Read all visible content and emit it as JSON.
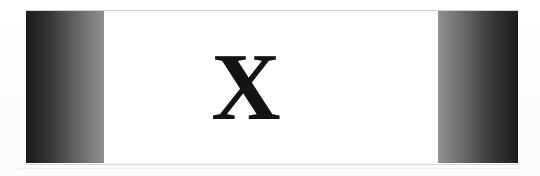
{
  "page": {
    "background_color": "#fdfdfd",
    "width": 540,
    "height": 176
  },
  "banner": {
    "name": "scanned-banner",
    "letter": "X",
    "letter_color": "#131313",
    "center_panel_color": "#ffffff",
    "left_band": {
      "label": "left-gradient-band",
      "gradient_from": "#1b1b1b",
      "gradient_to": "#8f8f8f",
      "direction": "dark-to-light"
    },
    "right_band": {
      "label": "right-gradient-band",
      "gradient_from": "#8f8f8f",
      "gradient_to": "#1b1b1b",
      "direction": "light-to-dark"
    },
    "rules": {
      "top_color": "#cfcfcf",
      "bottom_color": "#d9d9d9"
    }
  }
}
